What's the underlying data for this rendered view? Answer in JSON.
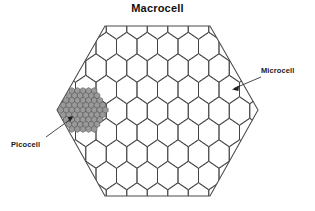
{
  "figure": {
    "title": "Macrocell",
    "background_color": "#ffffff",
    "line_color": "#3a3a3a",
    "macrocell_line_color": "#4a4a4a",
    "picocell_fill": "#9a9a9a"
  },
  "labels": {
    "macrocell": "Macrocell",
    "microcell": "Microcell",
    "picocell": "Picocell"
  },
  "diagram_data": {
    "type": "diagram",
    "description": "Hierarchical cellular network coverage diagram: one large macrocell hexagon tiled with many smaller microcell hexagons, and one dense cluster of picocells near the left vertex.",
    "macrocell": {
      "shape": "hexagon",
      "orientation": "flat-top",
      "vertices": [
        [
          57,
          110
        ],
        [
          105,
          26
        ],
        [
          210,
          26
        ],
        [
          258,
          110
        ],
        [
          210,
          196
        ],
        [
          105,
          196
        ]
      ],
      "center": [
        157.5,
        111
      ],
      "count": 1
    },
    "microcell": {
      "shape": "hexagon",
      "orientation": "pointy-top",
      "cell_width": 20.5,
      "cell_height": 28,
      "rows": 8,
      "columns": 8,
      "row_spacing": 21.5,
      "col_spacing": 20.5,
      "approx_count": 56,
      "pointer": {
        "from": [
          262,
          78
        ],
        "to": [
          233,
          89
        ]
      }
    },
    "picocell": {
      "shape": "hexagon",
      "orientation": "pointy-top",
      "cluster_shape": "hexagonal",
      "cell_width": 5.6,
      "cell_height": 6.4,
      "cluster_center": [
        83,
        110
      ],
      "cluster_radius": 4,
      "approx_count": 37,
      "pointer": {
        "from": [
          45,
          138
        ],
        "to": [
          71,
          119
        ]
      }
    }
  }
}
